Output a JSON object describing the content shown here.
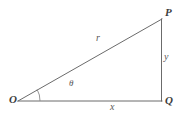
{
  "figure": {
    "background_color": "#ffffff",
    "width": 180,
    "height": 117
  },
  "style": {
    "line_color": "#6b6b6b",
    "arc_color": "#8a8a8a",
    "vertex_label_color": "#3d3d3d",
    "side_label_color": "#585858",
    "line_width": 1
  },
  "vertices": {
    "O": {
      "label": "O",
      "x": 18,
      "y": 101
    },
    "P": {
      "label": "P",
      "x": 162,
      "y": 19
    },
    "Q": {
      "label": "Q",
      "x": 162,
      "y": 101
    }
  },
  "sides": {
    "hypotenuse": {
      "label": "r",
      "from": "O",
      "to": "P"
    },
    "vertical": {
      "label": "y",
      "from": "P",
      "to": "Q"
    },
    "base": {
      "label": "x",
      "from": "O",
      "to": "Q"
    }
  },
  "angle": {
    "label": "θ",
    "at_vertex": "O",
    "between": [
      "base",
      "hypotenuse"
    ],
    "arc_radius": 22
  }
}
